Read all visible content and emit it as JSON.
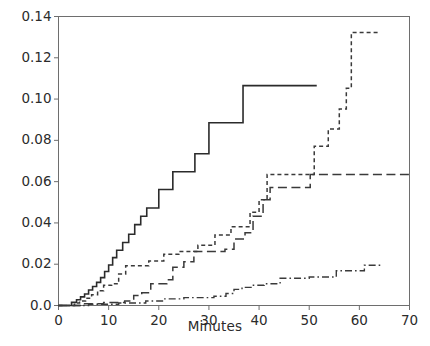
{
  "chart_data": {
    "type": "line",
    "title": "",
    "subtitle": "",
    "xlabel": "Minutes",
    "ylabel": "",
    "xlim": [
      0,
      70
    ],
    "ylim": [
      0.0,
      0.14
    ],
    "xticks": [
      0,
      10,
      20,
      30,
      40,
      50,
      60,
      70
    ],
    "xtick_labels": [
      "0",
      "10",
      "20",
      "30",
      "40",
      "50",
      "60",
      "70"
    ],
    "yticks": [
      0.0,
      0.02,
      0.04,
      0.06,
      0.08,
      0.1,
      0.12,
      0.14
    ],
    "ytick_labels": [
      "0.0",
      "0.02",
      "0.04",
      "0.06",
      "0.08",
      "0.10",
      "0.12",
      "0.14"
    ],
    "grid": false,
    "legend": "none",
    "frame": "box",
    "annotations": [],
    "series": [
      {
        "name": "series-solid",
        "style": "solid",
        "color": "#2b2b2b",
        "width": 1.6,
        "interpolation": "step-post",
        "points": [
          [
            0.0,
            0.0
          ],
          [
            2.6,
            0.0
          ],
          [
            2.6,
            0.0015
          ],
          [
            3.6,
            0.0015
          ],
          [
            3.6,
            0.0028
          ],
          [
            4.4,
            0.0028
          ],
          [
            4.4,
            0.0042
          ],
          [
            5.2,
            0.0042
          ],
          [
            5.2,
            0.0056
          ],
          [
            6.0,
            0.0056
          ],
          [
            6.0,
            0.0075
          ],
          [
            6.8,
            0.0075
          ],
          [
            6.8,
            0.0092
          ],
          [
            7.6,
            0.0092
          ],
          [
            7.6,
            0.0112
          ],
          [
            8.4,
            0.0112
          ],
          [
            8.4,
            0.0135
          ],
          [
            9.2,
            0.0135
          ],
          [
            9.2,
            0.0165
          ],
          [
            10.0,
            0.0165
          ],
          [
            10.0,
            0.0196
          ],
          [
            10.8,
            0.0196
          ],
          [
            10.8,
            0.0232
          ],
          [
            11.6,
            0.0232
          ],
          [
            11.6,
            0.0268
          ],
          [
            12.8,
            0.0268
          ],
          [
            12.8,
            0.0305
          ],
          [
            14.0,
            0.0305
          ],
          [
            14.0,
            0.0345
          ],
          [
            15.2,
            0.0345
          ],
          [
            15.2,
            0.0392
          ],
          [
            16.4,
            0.0392
          ],
          [
            16.4,
            0.0432
          ],
          [
            17.6,
            0.0432
          ],
          [
            17.6,
            0.0472
          ],
          [
            20.0,
            0.0472
          ],
          [
            20.0,
            0.0562
          ],
          [
            22.8,
            0.0562
          ],
          [
            22.8,
            0.0648
          ],
          [
            27.2,
            0.0648
          ],
          [
            27.2,
            0.0735
          ],
          [
            30.0,
            0.0735
          ],
          [
            30.0,
            0.0885
          ],
          [
            36.8,
            0.0885
          ],
          [
            36.8,
            0.1065
          ],
          [
            51.5,
            0.1065
          ]
        ]
      },
      {
        "name": "series-short-dash",
        "style": "dashed",
        "color": "#3a3a3a",
        "width": 1.5,
        "interpolation": "step-post",
        "points": [
          [
            0.0,
            0.0
          ],
          [
            3.2,
            0.0
          ],
          [
            3.2,
            0.0012
          ],
          [
            4.2,
            0.0012
          ],
          [
            4.2,
            0.0022
          ],
          [
            5.4,
            0.0022
          ],
          [
            5.4,
            0.0035
          ],
          [
            6.6,
            0.0035
          ],
          [
            6.6,
            0.0052
          ],
          [
            7.8,
            0.0052
          ],
          [
            7.8,
            0.0072
          ],
          [
            9.0,
            0.0072
          ],
          [
            9.0,
            0.0098
          ],
          [
            10.6,
            0.0098
          ],
          [
            10.6,
            0.0105
          ],
          [
            12.0,
            0.0105
          ],
          [
            12.0,
            0.0152
          ],
          [
            13.4,
            0.0152
          ],
          [
            13.4,
            0.0192
          ],
          [
            18.0,
            0.0192
          ],
          [
            18.0,
            0.0215
          ],
          [
            21.0,
            0.0215
          ],
          [
            21.0,
            0.0248
          ],
          [
            24.0,
            0.0248
          ],
          [
            24.0,
            0.0262
          ],
          [
            27.8,
            0.0262
          ],
          [
            27.8,
            0.0292
          ],
          [
            31.2,
            0.0292
          ],
          [
            31.2,
            0.0342
          ],
          [
            34.4,
            0.0342
          ],
          [
            34.4,
            0.0382
          ],
          [
            38.2,
            0.0382
          ],
          [
            38.2,
            0.0452
          ],
          [
            40.0,
            0.0452
          ],
          [
            40.0,
            0.0512
          ],
          [
            41.6,
            0.0512
          ],
          [
            41.6,
            0.0635
          ],
          [
            51.0,
            0.0635
          ],
          [
            51.0,
            0.0772
          ],
          [
            53.8,
            0.0772
          ],
          [
            53.8,
            0.0855
          ],
          [
            56.0,
            0.0855
          ],
          [
            56.0,
            0.0952
          ],
          [
            57.4,
            0.0952
          ],
          [
            57.4,
            0.1052
          ],
          [
            58.4,
            0.1052
          ],
          [
            58.4,
            0.1322
          ],
          [
            64.2,
            0.1322
          ]
        ]
      },
      {
        "name": "series-long-dash",
        "style": "long-dashed",
        "color": "#3a3a3a",
        "width": 1.5,
        "interpolation": "step-post",
        "points": [
          [
            0.0,
            0.0
          ],
          [
            5.0,
            0.0
          ],
          [
            5.0,
            0.0008
          ],
          [
            9.0,
            0.0008
          ],
          [
            9.0,
            0.0015
          ],
          [
            13.2,
            0.0015
          ],
          [
            13.2,
            0.0022
          ],
          [
            15.0,
            0.0022
          ],
          [
            15.0,
            0.0048
          ],
          [
            16.6,
            0.0048
          ],
          [
            16.6,
            0.0062
          ],
          [
            18.4,
            0.0062
          ],
          [
            18.4,
            0.0105
          ],
          [
            21.6,
            0.0105
          ],
          [
            21.6,
            0.0125
          ],
          [
            22.8,
            0.0125
          ],
          [
            22.8,
            0.0185
          ],
          [
            25.0,
            0.0185
          ],
          [
            25.0,
            0.0212
          ],
          [
            27.0,
            0.0212
          ],
          [
            27.0,
            0.0262
          ],
          [
            33.2,
            0.0262
          ],
          [
            33.2,
            0.0272
          ],
          [
            35.0,
            0.0272
          ],
          [
            35.0,
            0.0322
          ],
          [
            37.2,
            0.0322
          ],
          [
            37.2,
            0.0352
          ],
          [
            38.8,
            0.0352
          ],
          [
            38.8,
            0.0432
          ],
          [
            40.8,
            0.0432
          ],
          [
            40.8,
            0.0512
          ],
          [
            42.2,
            0.0512
          ],
          [
            42.2,
            0.0572
          ],
          [
            50.2,
            0.0572
          ],
          [
            50.2,
            0.0635
          ],
          [
            70.0,
            0.0635
          ]
        ]
      },
      {
        "name": "series-dash-dot",
        "style": "dash-dot",
        "color": "#3a3a3a",
        "width": 1.4,
        "interpolation": "step-post",
        "points": [
          [
            0.0,
            0.0
          ],
          [
            6.0,
            0.0
          ],
          [
            6.0,
            0.0006
          ],
          [
            12.0,
            0.0006
          ],
          [
            12.0,
            0.0012
          ],
          [
            17.4,
            0.0012
          ],
          [
            17.4,
            0.0022
          ],
          [
            21.0,
            0.0022
          ],
          [
            21.0,
            0.0032
          ],
          [
            25.0,
            0.0032
          ],
          [
            25.0,
            0.0038
          ],
          [
            31.0,
            0.0038
          ],
          [
            31.0,
            0.0045
          ],
          [
            33.4,
            0.0045
          ],
          [
            33.4,
            0.0058
          ],
          [
            35.0,
            0.0058
          ],
          [
            35.0,
            0.0078
          ],
          [
            36.6,
            0.0078
          ],
          [
            36.6,
            0.0088
          ],
          [
            38.4,
            0.0088
          ],
          [
            38.4,
            0.0098
          ],
          [
            41.0,
            0.0098
          ],
          [
            41.0,
            0.0105
          ],
          [
            44.2,
            0.0105
          ],
          [
            44.2,
            0.0132
          ],
          [
            50.0,
            0.0132
          ],
          [
            50.0,
            0.0138
          ],
          [
            55.4,
            0.0138
          ],
          [
            55.4,
            0.0168
          ],
          [
            61.0,
            0.0168
          ],
          [
            61.0,
            0.0195
          ],
          [
            64.2,
            0.0195
          ]
        ]
      }
    ]
  },
  "axis": {
    "x_title": "Minutes"
  }
}
